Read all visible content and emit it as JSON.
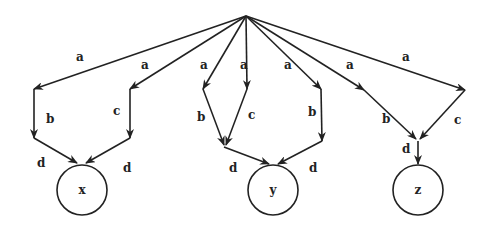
{
  "diagram": {
    "type": "tree-dag",
    "arrow_color": "#222222",
    "root": {
      "id": "root",
      "x": 246,
      "y": 16
    },
    "nodes": [
      {
        "id": "x",
        "label": "x",
        "cx": 82,
        "cy": 190,
        "r": 25
      },
      {
        "id": "y",
        "label": "y",
        "cx": 273,
        "cy": 190,
        "r": 25
      },
      {
        "id": "z",
        "label": "z",
        "cx": 418,
        "cy": 190,
        "r": 25
      }
    ],
    "paths": [
      {
        "name": "path-1-to-x",
        "target": "x",
        "segments": [
          {
            "label": "a",
            "from": [
              246,
              16
            ],
            "to": [
              34,
              89
            ],
            "label_pos": [
              76,
              61
            ]
          },
          {
            "label": "b",
            "from": [
              34,
              89
            ],
            "to": [
              34,
              138
            ],
            "label_pos": [
              45,
              123
            ]
          },
          {
            "label": "d",
            "from": [
              34,
              138
            ],
            "to": [
              77,
              163
            ],
            "label_pos": [
              36,
              166
            ]
          }
        ]
      },
      {
        "name": "path-2-to-x",
        "target": "x",
        "segments": [
          {
            "label": "a",
            "from": [
              246,
              16
            ],
            "to": [
              130,
              89
            ],
            "label_pos": [
              141,
              69
            ]
          },
          {
            "label": "c",
            "from": [
              130,
              89
            ],
            "to": [
              130,
              138
            ],
            "label_pos": [
              113,
              115
            ]
          },
          {
            "label": "d",
            "from": [
              130,
              138
            ],
            "to": [
              86,
              163
            ],
            "label_pos": [
              122,
              172
            ]
          }
        ]
      },
      {
        "name": "path-3-to-y",
        "target": "y",
        "segments": [
          {
            "label": "a",
            "from": [
              246,
              16
            ],
            "to": [
              203,
              89
            ],
            "label_pos": [
              200,
              69
            ]
          },
          {
            "label": "b",
            "from": [
              203,
              89
            ],
            "to": [
              224,
              145
            ],
            "label_pos": [
              197,
              121
            ]
          },
          {
            "label": "d",
            "from": [
              224,
              147
            ],
            "to": [
              269,
              164
            ],
            "label_pos": [
              230,
              172
            ]
          }
        ]
      },
      {
        "name": "path-4-to-y",
        "target": "y",
        "segments": [
          {
            "label": "a",
            "from": [
              246,
              16
            ],
            "to": [
              247,
              89
            ],
            "label_pos": [
              240,
              69
            ]
          },
          {
            "label": "c",
            "from": [
              247,
              89
            ],
            "to": [
              226,
              145
            ],
            "label_pos": [
              247,
              120
            ]
          },
          {
            "label": "d",
            "from": [
              224,
              147
            ],
            "to": [
              269,
              164
            ],
            "label_pos": [
              230,
              172
            ]
          }
        ]
      },
      {
        "name": "path-5-to-y",
        "target": "y",
        "segments": [
          {
            "label": "a",
            "from": [
              246,
              16
            ],
            "to": [
              321,
              89
            ],
            "label_pos": [
              284,
              69
            ]
          },
          {
            "label": "b",
            "from": [
              321,
              89
            ],
            "to": [
              322,
              141
            ],
            "label_pos": [
              307,
              116
            ]
          },
          {
            "label": "d",
            "from": [
              322,
              141
            ],
            "to": [
              278,
              164
            ],
            "label_pos": [
              310,
              172
            ]
          }
        ]
      },
      {
        "name": "path-6-to-z",
        "target": "z",
        "segments": [
          {
            "label": "a",
            "from": [
              246,
              16
            ],
            "to": [
              364,
              90
            ],
            "label_pos": [
              346,
              69
            ]
          },
          {
            "label": "b",
            "from": [
              364,
              90
            ],
            "to": [
              416,
              139
            ],
            "label_pos": [
              382,
              122
            ]
          },
          {
            "label": "d",
            "from": [
              418,
              141
            ],
            "to": [
              418,
              164
            ],
            "label_pos": [
              402,
              153
            ]
          }
        ]
      },
      {
        "name": "path-7-to-z",
        "target": "z",
        "segments": [
          {
            "label": "a",
            "from": [
              246,
              16
            ],
            "to": [
              465,
              90
            ],
            "label_pos": [
              404,
              61
            ]
          },
          {
            "label": "c",
            "from": [
              465,
              90
            ],
            "to": [
              420,
              139
            ],
            "label_pos": [
              454,
              124
            ]
          },
          {
            "label": "d",
            "from": [
              418,
              141
            ],
            "to": [
              418,
              164
            ],
            "label_pos": [
              402,
              153
            ]
          }
        ]
      }
    ],
    "edge_labels": [
      {
        "id": "l1",
        "text": "a",
        "x": 76,
        "y": 61
      },
      {
        "id": "l2",
        "text": "a",
        "x": 141,
        "y": 69
      },
      {
        "id": "l3",
        "text": "a",
        "x": 200,
        "y": 69
      },
      {
        "id": "l4",
        "text": "a",
        "x": 240,
        "y": 69
      },
      {
        "id": "l5",
        "text": "a",
        "x": 284,
        "y": 69
      },
      {
        "id": "l6",
        "text": "a",
        "x": 346,
        "y": 69
      },
      {
        "id": "l7",
        "text": "a",
        "x": 402,
        "y": 61
      },
      {
        "id": "l8",
        "text": "b",
        "x": 46,
        "y": 123
      },
      {
        "id": "l9",
        "text": "c",
        "x": 113,
        "y": 115
      },
      {
        "id": "l10",
        "text": "b",
        "x": 197,
        "y": 121
      },
      {
        "id": "l11",
        "text": "c",
        "x": 248,
        "y": 119
      },
      {
        "id": "l12",
        "text": "b",
        "x": 308,
        "y": 116
      },
      {
        "id": "l13",
        "text": "b",
        "x": 382,
        "y": 123
      },
      {
        "id": "l14",
        "text": "c",
        "x": 454,
        "y": 124
      },
      {
        "id": "l15",
        "text": "d",
        "x": 37,
        "y": 167
      },
      {
        "id": "l16",
        "text": "d",
        "x": 123,
        "y": 172
      },
      {
        "id": "l17",
        "text": "d",
        "x": 229,
        "y": 172
      },
      {
        "id": "l18",
        "text": "d",
        "x": 309,
        "y": 172
      },
      {
        "id": "l19",
        "text": "d",
        "x": 402,
        "y": 153
      }
    ]
  }
}
